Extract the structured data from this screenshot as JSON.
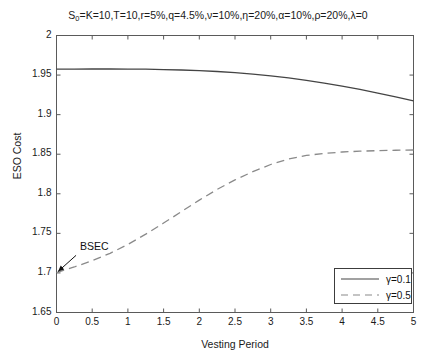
{
  "chart_data": {
    "type": "line",
    "title_parts": {
      "s": "S",
      "sub": "0",
      "rest": "=K=10,T=10,r=5%,q=4.5%,ν=10%,η=20%,α=10%,ρ=20%,λ=0"
    },
    "xlabel": "Vesting Period",
    "ylabel": "ESO Cost",
    "xlim": [
      0,
      5
    ],
    "ylim": [
      1.65,
      2
    ],
    "xticks": [
      0,
      0.5,
      1,
      1.5,
      2,
      2.5,
      3,
      3.5,
      4,
      4.5,
      5
    ],
    "xtick_labels": [
      "0",
      "0.5",
      "1",
      "1.5",
      "2",
      "2.5",
      "3",
      "3.5",
      "4",
      "4.5",
      "5"
    ],
    "yticks": [
      1.65,
      1.7,
      1.75,
      1.8,
      1.85,
      1.9,
      1.95,
      2
    ],
    "ytick_labels": [
      "1.65",
      "1.7",
      "1.75",
      "1.8",
      "1.85",
      "1.9",
      "1.95",
      "2"
    ],
    "grid": false,
    "legend_position": "lower right",
    "x": [
      0,
      0.25,
      0.5,
      0.75,
      1,
      1.25,
      1.5,
      1.75,
      2,
      2.25,
      2.5,
      2.75,
      3,
      3.25,
      3.5,
      3.75,
      4,
      4.25,
      4.5,
      4.75,
      5
    ],
    "series": [
      {
        "name": "γ=0.1",
        "label": "γ=0.1",
        "style": "solid",
        "color": "#444444",
        "values": [
          1.9575,
          1.9576,
          1.9577,
          1.9577,
          1.9576,
          1.9574,
          1.957,
          1.9564,
          1.9556,
          1.9545,
          1.9531,
          1.9513,
          1.9491,
          1.9464,
          1.9433,
          1.9398,
          1.936,
          1.9318,
          1.9273,
          1.9225,
          1.9173
        ]
      },
      {
        "name": "γ=0.5",
        "label": "γ=0.5",
        "style": "dashed",
        "color": "#8a8a8a",
        "values": [
          1.7005,
          1.7075,
          1.7155,
          1.7248,
          1.736,
          1.749,
          1.763,
          1.7775,
          1.792,
          1.8055,
          1.8175,
          1.828,
          1.837,
          1.844,
          1.8485,
          1.851,
          1.8528,
          1.8538,
          1.8545,
          1.855,
          1.8553
        ]
      }
    ],
    "annotations": [
      {
        "text": "BSEC",
        "target_x": 0,
        "target_y": 1.7005,
        "label_x": 0.33,
        "label_y": 1.726
      }
    ]
  }
}
